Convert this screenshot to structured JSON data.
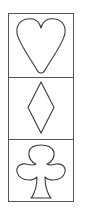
{
  "panel": {
    "label": "Card suit symbols",
    "border_color": "#555555",
    "stroke_color": "#3a3a3a",
    "background": "#ffffff",
    "cells": [
      {
        "suit": "heart",
        "icon": "heart-outline-icon"
      },
      {
        "suit": "diamond",
        "icon": "diamond-outline-icon"
      },
      {
        "suit": "club",
        "icon": "club-outline-icon"
      }
    ]
  }
}
